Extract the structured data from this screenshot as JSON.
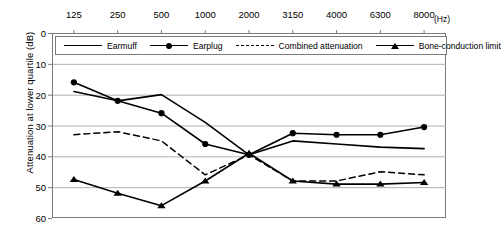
{
  "chart_data": {
    "type": "line",
    "title": "",
    "xlabel": "(Hz)",
    "ylabel": "Attenuation at lower quartile (dB)",
    "categories": [
      "125",
      "250",
      "500",
      "1000",
      "2000",
      "3150",
      "4000",
      "6300",
      "8000"
    ],
    "xlabel_unit": "(Hz)",
    "x_axis_position": "top",
    "y_inverted": true,
    "ylim": [
      0,
      60
    ],
    "yticks": [
      0,
      10,
      20,
      30,
      40,
      50,
      60
    ],
    "grid": "horizontal",
    "legend_position": "top-inside",
    "series": [
      {
        "name": "Earmuff",
        "style": "solid",
        "marker": "none",
        "values": [
          19,
          22,
          20,
          29,
          39.5,
          35,
          36,
          37,
          37.5
        ]
      },
      {
        "name": "Earplug",
        "style": "solid",
        "marker": "circle",
        "values": [
          16,
          22,
          26,
          36,
          39.5,
          32.5,
          33,
          33,
          30.5
        ]
      },
      {
        "name": "Combined attenuation",
        "style": "dashed",
        "marker": "none",
        "values": [
          33,
          32,
          35,
          46,
          39.5,
          48,
          48,
          45,
          46
        ]
      },
      {
        "name": "Bone-conduction limit",
        "style": "solid",
        "marker": "triangle",
        "values": [
          47.5,
          52,
          56,
          48,
          39,
          48,
          49,
          49,
          48.5
        ]
      }
    ]
  },
  "colors": {
    "line": "#000000",
    "grid": "#b0b0b0",
    "axis": "#7b7b7b",
    "background": "#ffffff"
  }
}
